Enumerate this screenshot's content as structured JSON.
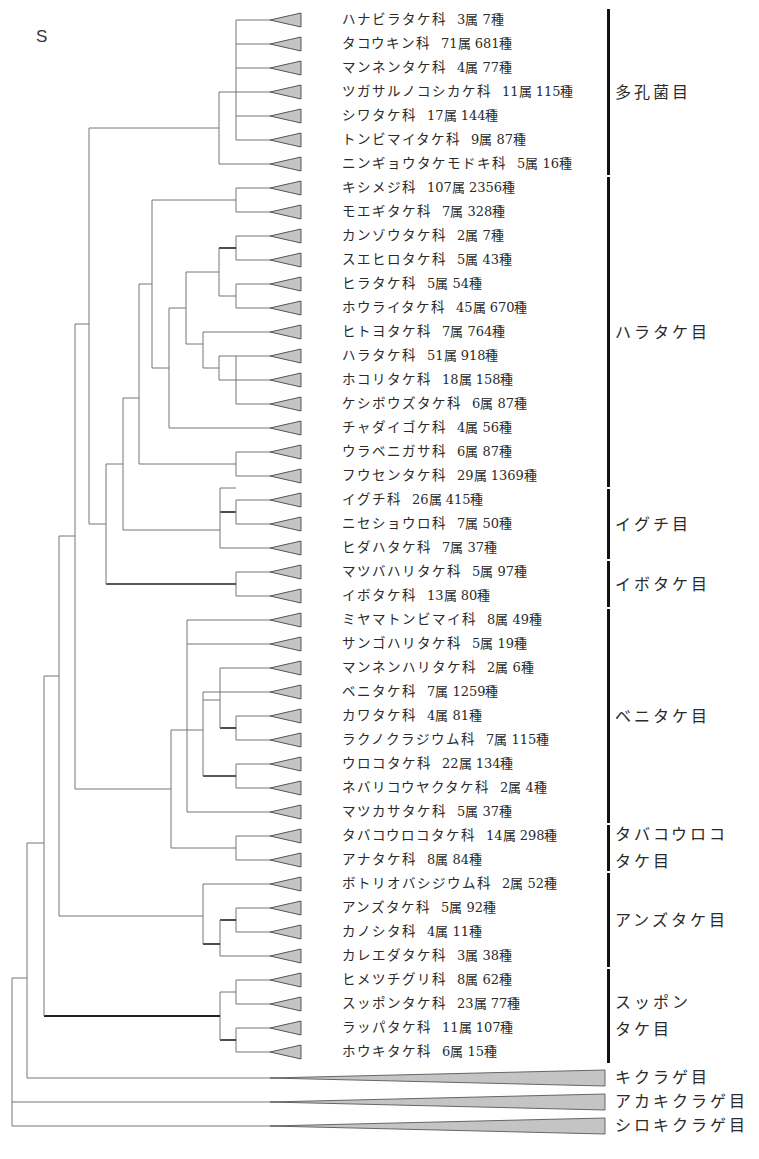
{
  "panel_letter": "S",
  "row": {
    "first_y": 20,
    "step": 24
  },
  "triangle": {
    "tip_x": 270,
    "base_x": 301,
    "half_h": 7,
    "fill": "#c4c4c4",
    "stroke": "#555555"
  },
  "leaves": [
    {
      "family": "ハナビラタケ科",
      "genera": "3属",
      "species": "7種"
    },
    {
      "family": "タコウキン科",
      "genera": "71属",
      "species": "681種"
    },
    {
      "family": "マンネンタケ科",
      "genera": "4属",
      "species": "77種"
    },
    {
      "family": "ツガサルノコシカケ科",
      "genera": "11属",
      "species": "115種"
    },
    {
      "family": "シワタケ科",
      "genera": "17属",
      "species": "144種"
    },
    {
      "family": "トンビマイタケ科",
      "genera": "9属",
      "species": "87種"
    },
    {
      "family": "ニンギョウタケモドキ科",
      "genera": "5属",
      "species": "16種"
    },
    {
      "family": "キシメジ科",
      "genera": "107属",
      "species": "2356種"
    },
    {
      "family": "モエギタケ科",
      "genera": "7属",
      "species": "328種"
    },
    {
      "family": "カンゾウタケ科",
      "genera": "2属",
      "species": "7種"
    },
    {
      "family": "スエヒロタケ科",
      "genera": "5属",
      "species": "43種"
    },
    {
      "family": "ヒラタケ科",
      "genera": "5属",
      "species": "54種"
    },
    {
      "family": "ホウライタケ科",
      "genera": "45属",
      "species": "670種"
    },
    {
      "family": "ヒトヨタケ科",
      "genera": "7属",
      "species": "764種"
    },
    {
      "family": "ハラタケ科",
      "genera": "51属",
      "species": "918種"
    },
    {
      "family": "ホコリタケ科",
      "genera": "18属",
      "species": "158種"
    },
    {
      "family": "ケシボウズタケ科",
      "genera": "6属",
      "species": "87種"
    },
    {
      "family": "チャダイゴケ科",
      "genera": "4属",
      "species": "56種"
    },
    {
      "family": "ウラベニガサ科",
      "genera": "6属",
      "species": "87種"
    },
    {
      "family": "フウセンタケ科",
      "genera": "29属",
      "species": "1369種"
    },
    {
      "family": "イグチ科",
      "genera": "26属",
      "species": "415種"
    },
    {
      "family": "ニセショウロ科",
      "genera": "7属",
      "species": "50種"
    },
    {
      "family": "ヒダハタケ科",
      "genera": "7属",
      "species": "37種"
    },
    {
      "family": "マツバハリタケ科",
      "genera": "5属",
      "species": "97種"
    },
    {
      "family": "イボタケ科",
      "genera": "13属",
      "species": "80種"
    },
    {
      "family": "ミヤマトンビマイ科",
      "genera": "8属",
      "species": "49種"
    },
    {
      "family": "サンゴハリタケ科",
      "genera": "5属",
      "species": "19種"
    },
    {
      "family": "マンネンハリタケ科",
      "genera": "2属",
      "species": "6種"
    },
    {
      "family": "ベニタケ科",
      "genera": "7属",
      "species": "1259種"
    },
    {
      "family": "カワタケ科",
      "genera": "4属",
      "species": "81種"
    },
    {
      "family": "ラクノクラジウム科",
      "genera": "7属",
      "species": "115種"
    },
    {
      "family": "ウロコタケ科",
      "genera": "22属",
      "species": "134種"
    },
    {
      "family": "ネバリコウヤクタケ科",
      "genera": "2属",
      "species": "4種"
    },
    {
      "family": "マツカサタケ科",
      "genera": "5属",
      "species": "37種"
    },
    {
      "family": "タバコウロコタケ科",
      "genera": "14属",
      "species": "298種"
    },
    {
      "family": "アナタケ科",
      "genera": "8属",
      "species": "84種"
    },
    {
      "family": "ボトリオバシジウム科",
      "genera": "2属",
      "species": "52種"
    },
    {
      "family": "アンズタケ科",
      "genera": "5属",
      "species": "92種"
    },
    {
      "family": "カノシタ科",
      "genera": "4属",
      "species": "11種"
    },
    {
      "family": "カレエダタケ科",
      "genera": "3属",
      "species": "38種"
    },
    {
      "family": "ヒメツチグリ科",
      "genera": "8属",
      "species": "62種"
    },
    {
      "family": "スッポンタケ科",
      "genera": "23属",
      "species": "77種"
    },
    {
      "family": "ラッパタケ科",
      "genera": "11属",
      "species": "107種"
    },
    {
      "family": "ホウキタケ科",
      "genera": "6属",
      "species": "15種"
    }
  ],
  "orders": [
    {
      "label": [
        "多孔菌目"
      ],
      "from": 0,
      "to": 6
    },
    {
      "label": [
        "ハラタケ目"
      ],
      "from": 7,
      "to": 19
    },
    {
      "label": [
        "イグチ目"
      ],
      "from": 20,
      "to": 22
    },
    {
      "label": [
        "イボタケ目"
      ],
      "from": 23,
      "to": 24
    },
    {
      "label": [
        "ベニタケ目"
      ],
      "from": 25,
      "to": 33
    },
    {
      "label": [
        "タバコウロコ",
        "タケ目"
      ],
      "from": 34,
      "to": 35
    },
    {
      "label": [
        "アンズタケ目"
      ],
      "from": 36,
      "to": 39
    },
    {
      "label": [
        "スッポン",
        "タケ目"
      ],
      "from": 40,
      "to": 43
    }
  ],
  "outgroups": [
    {
      "label": "キクラゲ目",
      "y": 1078
    },
    {
      "label": "アカキクラゲ目",
      "y": 1102
    },
    {
      "label": "シロキクラゲ目",
      "y": 1126
    }
  ],
  "tree_edges": [
    [
      236,
      20,
      270,
      20
    ],
    [
      236,
      44,
      270,
      44
    ],
    [
      236,
      68,
      270,
      68
    ],
    [
      236,
      92,
      270,
      92
    ],
    [
      236,
      116,
      270,
      116
    ],
    [
      236,
      140,
      270,
      140
    ],
    [
      236,
      20,
      236,
      140
    ],
    [
      219,
      92,
      236,
      92
    ],
    [
      219,
      164,
      270,
      164
    ],
    [
      219,
      92,
      219,
      164
    ],
    [
      89,
      128,
      219,
      128
    ],
    [
      236,
      188,
      270,
      188
    ],
    [
      236,
      212,
      270,
      212
    ],
    [
      236,
      188,
      236,
      212
    ],
    [
      236,
      236,
      270,
      236
    ],
    [
      236,
      260,
      270,
      260
    ],
    [
      236,
      236,
      236,
      260
    ],
    [
      236,
      284,
      270,
      284
    ],
    [
      236,
      308,
      270,
      308
    ],
    [
      236,
      284,
      236,
      308
    ],
    [
      219,
      248,
      236,
      248,
      1.6
    ],
    [
      219,
      296,
      236,
      296
    ],
    [
      219,
      248,
      219,
      296
    ],
    [
      236,
      332,
      270,
      332
    ],
    [
      219,
      356,
      270,
      356
    ],
    [
      219,
      380,
      270,
      380
    ],
    [
      219,
      356,
      219,
      380
    ],
    [
      236,
      404,
      270,
      404
    ],
    [
      236,
      356,
      236,
      404
    ],
    [
      203,
      368,
      219,
      368
    ],
    [
      203,
      332,
      203,
      368
    ],
    [
      203,
      332,
      236,
      332
    ],
    [
      186,
      272,
      219,
      272
    ],
    [
      186,
      344,
      203,
      344
    ],
    [
      186,
      272,
      186,
      344
    ],
    [
      169,
      308,
      186,
      308
    ],
    [
      169,
      428,
      270,
      428
    ],
    [
      169,
      308,
      169,
      428
    ],
    [
      152,
      200,
      236,
      200
    ],
    [
      152,
      368,
      169,
      368
    ],
    [
      152,
      200,
      152,
      368
    ],
    [
      139,
      284,
      152,
      284
    ],
    [
      139,
      464,
      236,
      464
    ],
    [
      139,
      284,
      139,
      464
    ],
    [
      236,
      452,
      270,
      452
    ],
    [
      236,
      476,
      270,
      476
    ],
    [
      236,
      452,
      236,
      476
    ],
    [
      220,
      512,
      236,
      512,
      1.6
    ],
    [
      236,
      500,
      270,
      500
    ],
    [
      236,
      524,
      270,
      524
    ],
    [
      236,
      500,
      236,
      524
    ],
    [
      220,
      548,
      270,
      548
    ],
    [
      220,
      488,
      220,
      548
    ],
    [
      220,
      488,
      236,
      488
    ],
    [
      123,
      530,
      220,
      530
    ],
    [
      123,
      398,
      139,
      398
    ],
    [
      123,
      398,
      123,
      530
    ],
    [
      236,
      572,
      270,
      572
    ],
    [
      236,
      596,
      270,
      596
    ],
    [
      236,
      572,
      236,
      596
    ],
    [
      106,
      584,
      236,
      584,
      1.6
    ],
    [
      106,
      464,
      123,
      464
    ],
    [
      106,
      464,
      106,
      584
    ],
    [
      89,
      524,
      106,
      524
    ],
    [
      187,
      620,
      270,
      620
    ],
    [
      187,
      644,
      270,
      644
    ],
    [
      220,
      668,
      270,
      668
    ],
    [
      236,
      716,
      270,
      716
    ],
    [
      236,
      740,
      270,
      740
    ],
    [
      236,
      716,
      236,
      740
    ],
    [
      220,
      728,
      236,
      728,
      1.6
    ],
    [
      220,
      668,
      220,
      728
    ],
    [
      203,
      692,
      270,
      692
    ],
    [
      203,
      700,
      220,
      700
    ],
    [
      236,
      764,
      270,
      764
    ],
    [
      236,
      788,
      270,
      788
    ],
    [
      236,
      764,
      236,
      788
    ],
    [
      203,
      776,
      236,
      776,
      1.6
    ],
    [
      203,
      692,
      203,
      776
    ],
    [
      187,
      812,
      270,
      812
    ],
    [
      187,
      730,
      203,
      730
    ],
    [
      187,
      620,
      187,
      812
    ],
    [
      236,
      836,
      270,
      836
    ],
    [
      236,
      860,
      270,
      860
    ],
    [
      236,
      836,
      236,
      860
    ],
    [
      171,
      730,
      187,
      730
    ],
    [
      171,
      848,
      236,
      848
    ],
    [
      171,
      730,
      171,
      848
    ],
    [
      75,
      789,
      171,
      789
    ],
    [
      203,
      884,
      270,
      884
    ],
    [
      236,
      908,
      270,
      908
    ],
    [
      236,
      932,
      270,
      932
    ],
    [
      236,
      908,
      236,
      932
    ],
    [
      220,
      920,
      236,
      920,
      1.6
    ],
    [
      220,
      956,
      270,
      956
    ],
    [
      220,
      920,
      220,
      956
    ],
    [
      203,
      944,
      220,
      944,
      1.6
    ],
    [
      203,
      884,
      203,
      944
    ],
    [
      59,
      916,
      203,
      916
    ],
    [
      236,
      980,
      270,
      980
    ],
    [
      236,
      1004,
      270,
      1004
    ],
    [
      236,
      980,
      236,
      1004
    ],
    [
      236,
      1028,
      270,
      1028
    ],
    [
      236,
      1052,
      270,
      1052
    ],
    [
      236,
      1028,
      236,
      1052
    ],
    [
      220,
      992,
      236,
      992
    ],
    [
      220,
      1040,
      236,
      1040,
      1.6
    ],
    [
      220,
      992,
      220,
      1040
    ],
    [
      44,
      1016,
      220,
      1016,
      2
    ],
    [
      89,
      128,
      89,
      524
    ],
    [
      75,
      324,
      89,
      324
    ],
    [
      75,
      324,
      75,
      789
    ],
    [
      59,
      536,
      75,
      536
    ],
    [
      59,
      536,
      59,
      916
    ],
    [
      44,
      676,
      59,
      676
    ],
    [
      44,
      676,
      44,
      1016
    ],
    [
      27,
      843,
      44,
      843
    ],
    [
      27,
      843,
      27,
      1078
    ],
    [
      27,
      1078,
      290,
      1078
    ],
    [
      12,
      978,
      27,
      978
    ],
    [
      12,
      978,
      12,
      1126
    ],
    [
      12,
      1102,
      290,
      1102
    ],
    [
      12,
      1126,
      290,
      1126
    ]
  ],
  "wide_triangles": [
    {
      "y": 1078,
      "tip_x": 270,
      "base_x": 605,
      "half_h": 8
    },
    {
      "y": 1102,
      "tip_x": 270,
      "base_x": 605,
      "half_h": 8
    },
    {
      "y": 1126,
      "tip_x": 270,
      "base_x": 605,
      "half_h": 8
    }
  ],
  "colors": {
    "line": "#777777",
    "thick": "#222222",
    "bar": "#111111",
    "tri_fill": "#c4c4c4"
  }
}
